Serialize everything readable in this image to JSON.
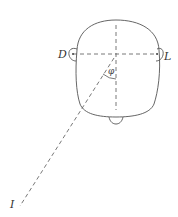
{
  "diagram": {
    "labels": {
      "left_ear": "D",
      "right_ear": "L",
      "source": "I",
      "angle": "φ"
    },
    "colors": {
      "stroke": "#555555",
      "background": "#ffffff"
    }
  }
}
